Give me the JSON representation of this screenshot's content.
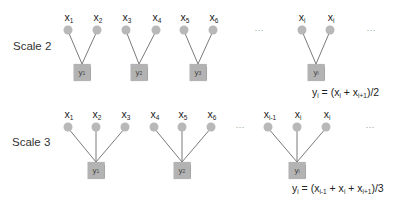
{
  "scale2": {
    "label": "Scale 2",
    "groups": [
      {
        "inputs": [
          {
            "base": "x",
            "sub": "1"
          },
          {
            "base": "x",
            "sub": "2"
          }
        ],
        "output": {
          "base": "y",
          "sub": "1"
        }
      },
      {
        "inputs": [
          {
            "base": "x",
            "sub": "3"
          },
          {
            "base": "x",
            "sub": "4"
          }
        ],
        "output": {
          "base": "y",
          "sub": "2"
        }
      },
      {
        "inputs": [
          {
            "base": "x",
            "sub": "5"
          },
          {
            "base": "x",
            "sub": "6"
          }
        ],
        "output": {
          "base": "y",
          "sub": "3"
        }
      },
      {
        "inputs": [
          {
            "base": "x",
            "sub": "i"
          },
          {
            "base": "x",
            "sub": "i"
          }
        ],
        "output": {
          "base": "y",
          "sub": "i"
        }
      }
    ],
    "ellipsis": "···",
    "formula": {
      "lhs_base": "y",
      "lhs_sub": "i",
      "eq": " = (x",
      "t1_sub": "i",
      "mid": " + x",
      "t2_sub": "i+1",
      "tail": ")/2"
    }
  },
  "scale3": {
    "label": "Scale 3",
    "groups": [
      {
        "inputs": [
          {
            "base": "x",
            "sub": "1"
          },
          {
            "base": "x",
            "sub": "2"
          },
          {
            "base": "x",
            "sub": "3"
          }
        ],
        "output": {
          "base": "y",
          "sub": "1"
        }
      },
      {
        "inputs": [
          {
            "base": "x",
            "sub": "4"
          },
          {
            "base": "x",
            "sub": "5"
          },
          {
            "base": "x",
            "sub": "6"
          }
        ],
        "output": {
          "base": "y",
          "sub": "2"
        }
      },
      {
        "inputs": [
          {
            "base": "x",
            "sub": "i-1"
          },
          {
            "base": "x",
            "sub": "i"
          },
          {
            "base": "x",
            "sub": "i"
          }
        ],
        "output": {
          "base": "y",
          "sub": "i"
        }
      }
    ],
    "ellipsis": "···",
    "formula": {
      "lhs_base": "y",
      "lhs_sub": "i",
      "eq": " = (x",
      "t1_sub": "i-1",
      "mid1": " + x",
      "t2_sub": "i",
      "mid2": " + x",
      "t3_sub": "i+1",
      "tail": ")/3"
    }
  },
  "colors": {
    "node": "#b8b8b8",
    "box": "#b3b3b3",
    "edge": "#7a7a7a"
  }
}
